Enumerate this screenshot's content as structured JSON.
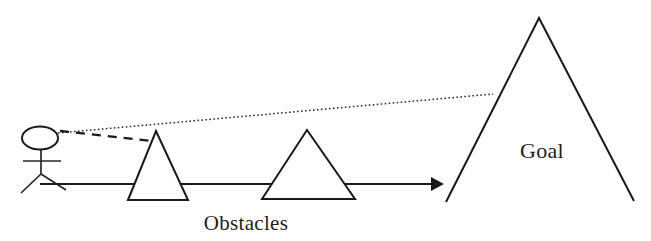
{
  "diagram": {
    "background_color": "#ffffff",
    "stroke_color": "#1a1a1a",
    "labels": {
      "obstacles": "Obstacles",
      "goal": "Goal"
    },
    "figure": {
      "name": "stick-figure",
      "head_shape": "oval",
      "head": {
        "cx": 40,
        "cy": 138,
        "rx": 18,
        "ry": 11.5
      },
      "body": {
        "x": 41,
        "y1": 149,
        "y2": 174
      },
      "arms": {
        "y": 161,
        "x1": 23,
        "x2": 61
      },
      "leg_left": {
        "x1": 41,
        "y1": 174,
        "x2": 21,
        "y2": 193
      },
      "leg_right": {
        "x1": 41,
        "y1": 174,
        "x2": 66,
        "y2": 190
      }
    },
    "ground_arrow": {
      "name": "path-arrow",
      "x1": 40,
      "y": 184,
      "x2": 432,
      "tip_x": 444,
      "head_half_height": 7
    },
    "sight_lines": [
      {
        "name": "line-of-sight-to-goal",
        "style": "dotted",
        "x1": 58,
        "y1": 133,
        "x2": 493,
        "y2": 94
      },
      {
        "name": "line-of-sight-to-obstacle",
        "style": "dashed",
        "x1": 60,
        "y1": 131,
        "x2": 152,
        "y2": 141
      }
    ],
    "obstacles": [
      {
        "name": "obstacle-triangle-1",
        "apex_x": 156,
        "apex_y": 131,
        "base_y": 200,
        "base_left_x": 128,
        "base_right_x": 188
      },
      {
        "name": "obstacle-triangle-2",
        "apex_x": 307,
        "apex_y": 130,
        "base_y": 199,
        "base_left_x": 262,
        "base_right_x": 355
      }
    ],
    "goal_mountain": {
      "name": "goal-mountain",
      "apex_x": 539,
      "apex_y": 18,
      "left_foot_x": 446,
      "left_foot_y": 202,
      "right_foot_x": 634,
      "right_foot_y": 201
    },
    "label_positions": {
      "obstacles": {
        "x": 246,
        "y": 230,
        "anchor": "middle"
      },
      "goal": {
        "x": 542,
        "y": 158,
        "anchor": "middle"
      }
    }
  }
}
